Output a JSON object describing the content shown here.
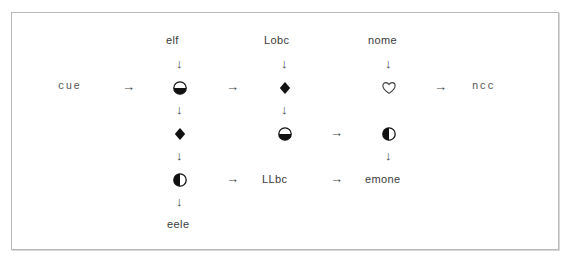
{
  "figure": {
    "border_color": "#b9b9b9",
    "background": "#ffffff",
    "text_color": "#3a3a3a"
  },
  "glyphs": {
    "circle_bottom_half": "circle-bottom-half-filled",
    "circle_left_half": "circle-left-half-filled",
    "diamond_filled": "diamond-filled",
    "heart_outline": "heart-outline",
    "arrow_right": "→",
    "arrow_down": "↓"
  },
  "labels": {
    "start_left": "cue",
    "col1_top": "elf",
    "col2_top": "Lobc",
    "col3_top": "nome",
    "end_right": "ncc",
    "col1_bottom": "eele",
    "col2_bottom": "LLbc",
    "col3_bottom": "emone"
  },
  "nodes": [
    {
      "id": "n-start-left",
      "kind": "label",
      "text": "cue",
      "x": 58,
      "y": 80
    },
    {
      "id": "n-col1-top",
      "kind": "label",
      "text": "elf",
      "x": 166,
      "y": 34
    },
    {
      "id": "n-col2-top",
      "kind": "label",
      "text": "Lobc",
      "x": 264,
      "y": 34
    },
    {
      "id": "n-col3-top",
      "kind": "label",
      "text": "nome",
      "x": 368,
      "y": 34
    },
    {
      "id": "n-end-right",
      "kind": "label",
      "text": "ncc",
      "x": 472,
      "y": 80
    },
    {
      "id": "n-col1-bottom",
      "kind": "label",
      "text": "eele",
      "x": 167,
      "y": 218
    },
    {
      "id": "n-col2-bottom",
      "kind": "label",
      "text": "LLbc",
      "x": 262,
      "y": 173
    },
    {
      "id": "n-col3-bottom",
      "kind": "label",
      "text": "emone",
      "x": 365,
      "y": 173
    },
    {
      "id": "s-r1c1",
      "kind": "symbol",
      "glyph": "circle-bottom-half-filled",
      "x": 172,
      "y": 80
    },
    {
      "id": "s-r1c2",
      "kind": "symbol",
      "glyph": "diamond-filled",
      "x": 277,
      "y": 80
    },
    {
      "id": "s-r1c3",
      "kind": "symbol",
      "glyph": "heart-outline",
      "x": 381,
      "y": 80
    },
    {
      "id": "s-r2c1",
      "kind": "symbol",
      "glyph": "diamond-filled",
      "x": 172,
      "y": 126
    },
    {
      "id": "s-r2c2",
      "kind": "symbol",
      "glyph": "circle-bottom-half-filled",
      "x": 277,
      "y": 126
    },
    {
      "id": "s-r2c3",
      "kind": "symbol",
      "glyph": "circle-left-half-filled",
      "x": 381,
      "y": 126
    },
    {
      "id": "s-r3c1",
      "kind": "symbol",
      "glyph": "circle-left-half-filled",
      "x": 172,
      "y": 172
    }
  ],
  "connectors": {
    "right_arrows": [
      {
        "id": "a-start-to-c1",
        "x": 122,
        "y": 80
      },
      {
        "id": "a-c1-to-c2",
        "x": 226,
        "y": 80
      },
      {
        "id": "a-c3-to-end",
        "x": 434,
        "y": 80
      },
      {
        "id": "a-r2c2-to-r2c3",
        "x": 330,
        "y": 126
      },
      {
        "id": "a-r3c1-to-lbl",
        "x": 226,
        "y": 172
      },
      {
        "id": "a-lbl-to-emone",
        "x": 330,
        "y": 172
      }
    ],
    "down_arrows": [
      {
        "id": "d-c1-top",
        "x": 176,
        "y": 57
      },
      {
        "id": "d-c2-top",
        "x": 281,
        "y": 57
      },
      {
        "id": "d-c3-top",
        "x": 385,
        "y": 57
      },
      {
        "id": "d-c1-mid",
        "x": 176,
        "y": 103
      },
      {
        "id": "d-c2-mid",
        "x": 281,
        "y": 103
      },
      {
        "id": "d-c1-low",
        "x": 176,
        "y": 149
      },
      {
        "id": "d-c3-mid",
        "x": 385,
        "y": 149
      },
      {
        "id": "d-c1-bottom",
        "x": 176,
        "y": 195
      }
    ]
  }
}
